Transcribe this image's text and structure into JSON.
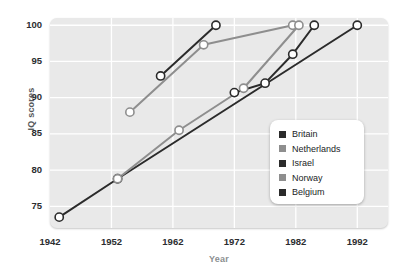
{
  "chart_data": {
    "type": "line",
    "title": "",
    "xlabel": "Year",
    "ylabel": "IQ scores",
    "xlim": [
      1942,
      1997
    ],
    "ylim": [
      72,
      101
    ],
    "xticks": [
      1942,
      1952,
      1962,
      1972,
      1982,
      1992
    ],
    "yticks": [
      75,
      80,
      85,
      90,
      95,
      100
    ],
    "grid": true,
    "legend_position": "center-right",
    "series": [
      {
        "name": "Britain",
        "color": "#2b2b2b",
        "points": [
          {
            "x": 1943.5,
            "y": 73.5
          },
          {
            "x": 1953.0,
            "y": 78.8
          },
          {
            "x": 1992.0,
            "y": 100.0
          }
        ]
      },
      {
        "name": "Netherlands",
        "color": "#8e8e8e",
        "points": [
          {
            "x": 1955.0,
            "y": 88.0
          },
          {
            "x": 1967.0,
            "y": 97.3
          },
          {
            "x": 1981.5,
            "y": 100.0
          }
        ]
      },
      {
        "name": "Israel",
        "color": "#2b2b2b",
        "points": [
          {
            "x": 1960.0,
            "y": 93.0
          },
          {
            "x": 1969.0,
            "y": 100.0
          }
        ]
      },
      {
        "name": "Norway",
        "color": "#8e8e8e",
        "points": [
          {
            "x": 1953.0,
            "y": 78.8
          },
          {
            "x": 1963.0,
            "y": 85.5
          },
          {
            "x": 1973.5,
            "y": 91.3
          },
          {
            "x": 1982.5,
            "y": 100.0
          }
        ]
      },
      {
        "name": "Belgium",
        "color": "#2b2b2b",
        "points": [
          {
            "x": 1972.0,
            "y": 90.7
          },
          {
            "x": 1977.0,
            "y": 92.0
          },
          {
            "x": 1981.5,
            "y": 96.0
          },
          {
            "x": 1985.0,
            "y": 100.0
          }
        ]
      }
    ]
  },
  "legend": {
    "items": [
      {
        "label": "Britain",
        "color": "#2b2b2b"
      },
      {
        "label": "Netherlands",
        "color": "#8e8e8e"
      },
      {
        "label": "Israel",
        "color": "#2b2b2b"
      },
      {
        "label": "Norway",
        "color": "#8e8e8e"
      },
      {
        "label": "Belgium",
        "color": "#2b2b2b"
      }
    ]
  },
  "axes": {
    "y_title": "IQ scores",
    "x_title": "Year",
    "y_tick_labels": [
      "100",
      "95",
      "90",
      "85",
      "80",
      "75"
    ],
    "x_tick_labels": [
      "1942",
      "1952",
      "1962",
      "1972",
      "1982",
      "1992"
    ]
  },
  "style": {
    "plot_background": "#e9e9e9",
    "grid_color": "#ffffff",
    "marker_fill": "#ffffff"
  }
}
